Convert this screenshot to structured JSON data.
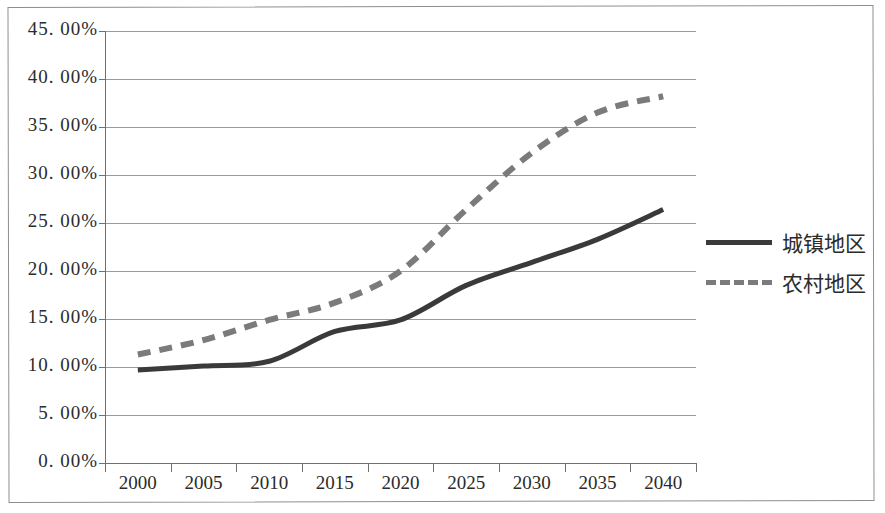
{
  "chart_data": {
    "type": "line",
    "title": "",
    "xlabel": "",
    "ylabel": "",
    "categories": [
      "2000",
      "2005",
      "2010",
      "2015",
      "2020",
      "2025",
      "2030",
      "2035",
      "2040"
    ],
    "ytick_labels": [
      "45. 00%",
      "40. 00%",
      "35. 00%",
      "30. 00%",
      "25. 00%",
      "20. 00%",
      "15. 00%",
      "10. 00%",
      "5. 00%",
      "0. 00%"
    ],
    "ytick_values": [
      45,
      40,
      35,
      30,
      25,
      20,
      15,
      10,
      5,
      0
    ],
    "ylim": [
      0,
      45
    ],
    "grid": "horizontal",
    "legend_position": "right",
    "series": [
      {
        "name": "城镇地区",
        "style": "solid",
        "color": "#3a3a3a",
        "values": [
          9.7,
          10.1,
          10.6,
          13.7,
          14.9,
          18.5,
          20.9,
          23.3,
          26.4
        ]
      },
      {
        "name": "农村地区",
        "style": "dashed",
        "color": "#7b7b7b",
        "values": [
          11.3,
          12.8,
          14.9,
          16.7,
          20.0,
          26.4,
          32.3,
          36.5,
          38.2
        ]
      }
    ]
  },
  "colors": {
    "axis": "#6f6f6f",
    "grid": "#9a9a9a",
    "frame": "#8e8e8e",
    "text": "#2b2b2b",
    "background": "#ffffff"
  }
}
